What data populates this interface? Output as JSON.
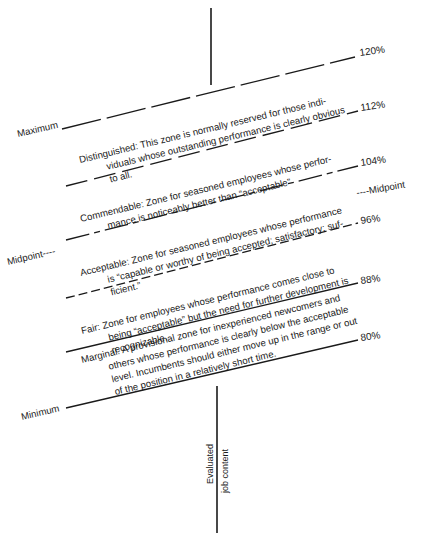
{
  "diagram": {
    "type": "salary-range-performance-zones",
    "axis_label": {
      "line1": "Evaluated",
      "line2": "job content"
    },
    "range_labels": {
      "maximum": "Maximum",
      "minimum": "Minimum",
      "midpoint_left": "Midpoint----",
      "midpoint_right": "----Midpoint"
    },
    "percent_marks": [
      {
        "label": "120%",
        "value": 120,
        "style": "long-dash"
      },
      {
        "label": "112%",
        "value": 112,
        "style": "long-dash"
      },
      {
        "label": "104%",
        "value": 104,
        "style": "long-short-dash"
      },
      {
        "label": "96%",
        "value": 96,
        "style": "short-dash"
      },
      {
        "label": "88%",
        "value": 88,
        "style": "solid"
      },
      {
        "label": "80%",
        "value": 80,
        "style": "solid"
      }
    ],
    "zones": [
      {
        "name": "Distinguished",
        "range": "112%–120%",
        "lines": [
          "Distinguished:  This zone is normally reserved for those indi-",
          "viduals whose outstanding performance is  clearly obvious",
          "to all."
        ]
      },
      {
        "name": "Commendable",
        "range": "104%–112%",
        "lines": [
          "Commendable:  Zone for seasoned employees whose perfor-",
          "mance is noticeably better than “acceptable”"
        ]
      },
      {
        "name": "Acceptable",
        "range": "96%–104%",
        "lines": [
          "Acceptable:  Zone for seasoned employees whose performance",
          "is “capable or worthy of being accepted; satisfactory; suf-",
          "ficient.”"
        ]
      },
      {
        "name": "Fair",
        "range": "88%–96%",
        "lines": [
          "Fair:  Zone for employees whose performance comes close to",
          "being “acceptable” but the need for further development is",
          "recognizable."
        ]
      },
      {
        "name": "Marginal",
        "range": "80%–88%",
        "lines": [
          "Marginal:  A provisional zone for inexperienced newcomers and",
          "others whose performance is clearly below the acceptable",
          "level.  Incumbents should either move up in the range or out",
          "of the position in a relatively short time."
        ]
      }
    ]
  }
}
